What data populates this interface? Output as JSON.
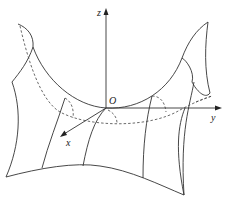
{
  "diagram": {
    "type": "3d-surface-sketch",
    "axes": {
      "x_label": "x",
      "y_label": "y",
      "z_label": "z",
      "origin_label": "O"
    },
    "colors": {
      "line": "#333333",
      "background": "#ffffff"
    }
  }
}
